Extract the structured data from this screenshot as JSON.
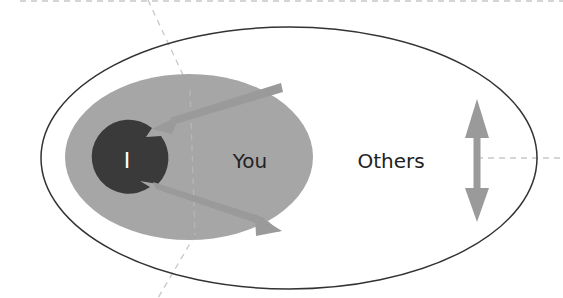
{
  "diagram": {
    "labels": {
      "self": "I",
      "you": "You",
      "others": "Others"
    },
    "colors": {
      "background": "#ffffff",
      "outer_ellipse_stroke": "#333333",
      "you_bubble_fill": "#a6a6a6",
      "self_circle_fill": "#3a3a3a",
      "arrow_fill": "#9a9a9a",
      "guide_line": "#c8c8c8",
      "self_label": "#ffffff",
      "text": "#222222"
    },
    "elements": [
      {
        "id": "others-ellipse",
        "shape": "ellipse",
        "label": "Others"
      },
      {
        "id": "you-bubble",
        "shape": "speech-bubble",
        "label": "You"
      },
      {
        "id": "self-circle",
        "shape": "notched-circle",
        "label": "I"
      },
      {
        "id": "incoming-arrow",
        "shape": "arrow",
        "direction": "into I from upper right"
      },
      {
        "id": "outgoing-arrow",
        "shape": "arrow",
        "direction": "out of I toward lower right"
      },
      {
        "id": "vertical-double-arrow",
        "shape": "double-arrow",
        "direction": "up-down"
      }
    ]
  }
}
